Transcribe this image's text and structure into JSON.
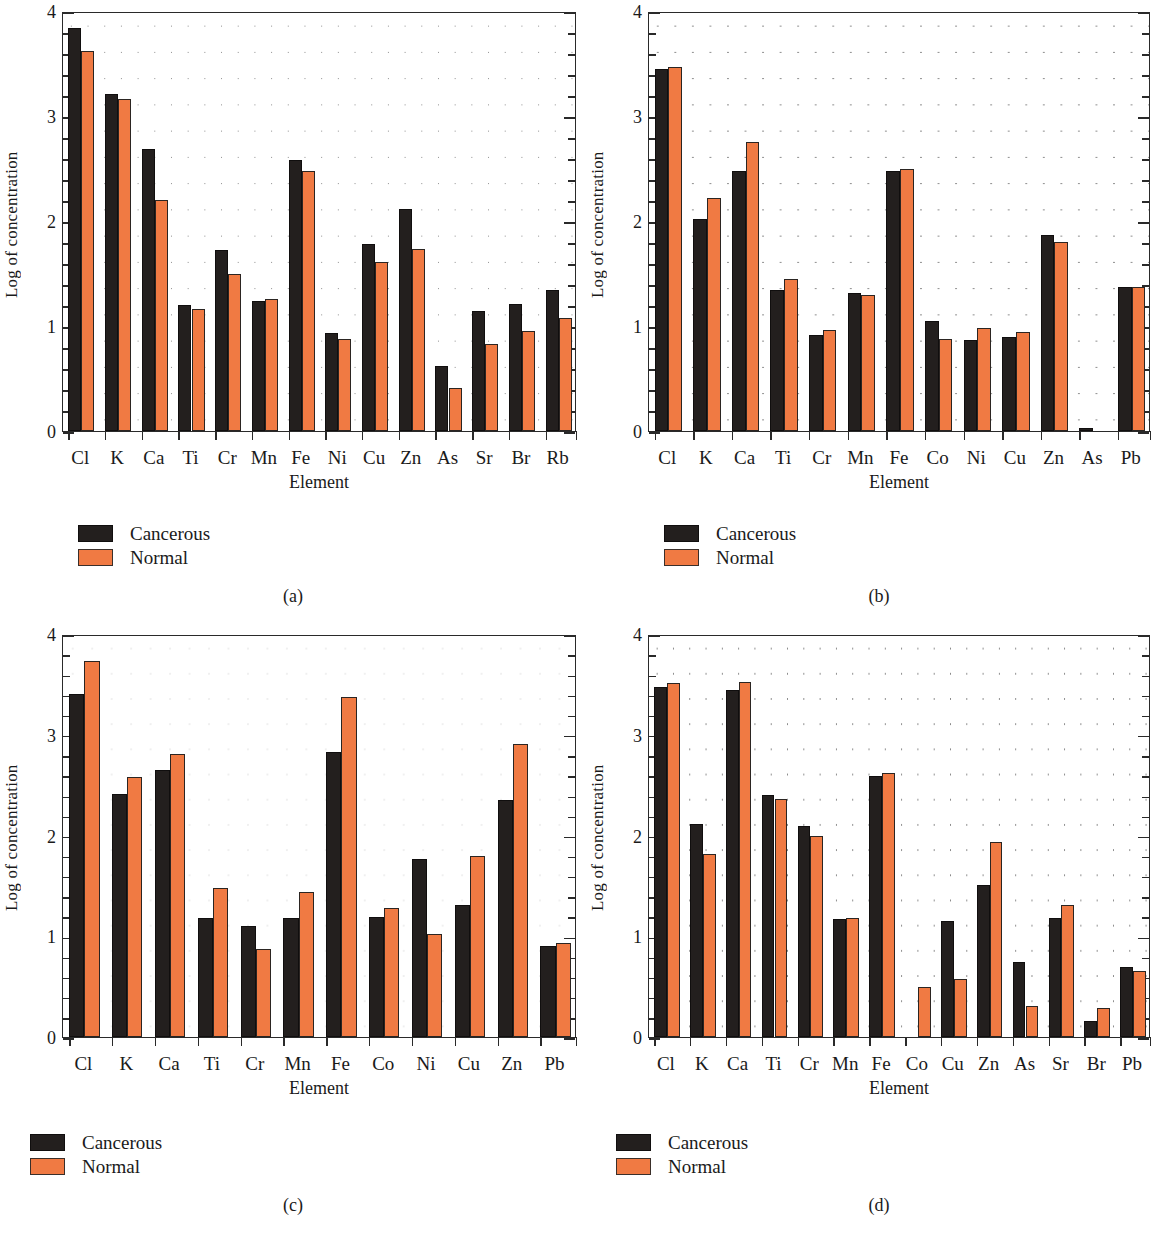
{
  "figure": {
    "axis": {
      "ylabel": "Log of concentration",
      "xlabel": "Element",
      "yticks": [
        "0",
        "1",
        "2",
        "3",
        "4"
      ],
      "ylim": [
        0,
        4
      ]
    },
    "legend": {
      "cancerous_label": "Cancerous",
      "normal_label": "Normal",
      "cancerous_color": "#231f1e",
      "normal_color": "#f07a43"
    },
    "captions": [
      "(a)",
      "(b)",
      "(c)",
      "(d)"
    ]
  },
  "chart_data": [
    {
      "type": "bar",
      "panel": "(a)",
      "title": "",
      "xlabel": "Element",
      "ylabel": "Log of concentration",
      "ylim": [
        0,
        4
      ],
      "grid": "dotted",
      "legend_position": "below-left",
      "categories": [
        "Cl",
        "K",
        "Ca",
        "Ti",
        "Cr",
        "Mn",
        "Fe",
        "Ni",
        "Cu",
        "Zn",
        "As",
        "Sr",
        "Br",
        "Rb"
      ],
      "series": [
        {
          "name": "Cancerous",
          "color": "#231f1e",
          "values": [
            3.84,
            3.21,
            2.69,
            1.2,
            1.72,
            1.24,
            2.58,
            0.93,
            1.78,
            2.11,
            0.62,
            1.14,
            1.21,
            1.34
          ]
        },
        {
          "name": "Normal",
          "color": "#f07a43",
          "values": [
            3.62,
            3.16,
            2.2,
            1.16,
            1.5,
            1.26,
            2.48,
            0.88,
            1.61,
            1.73,
            0.41,
            0.83,
            0.95,
            1.08
          ]
        }
      ]
    },
    {
      "type": "bar",
      "panel": "(b)",
      "title": "",
      "xlabel": "Element",
      "ylabel": "Log of concentration",
      "ylim": [
        0,
        4
      ],
      "grid": "dotted",
      "legend_position": "below-left",
      "categories": [
        "Cl",
        "K",
        "Ca",
        "Ti",
        "Cr",
        "Mn",
        "Fe",
        "Co",
        "Ni",
        "Cu",
        "Zn",
        "As",
        "Pb"
      ],
      "series": [
        {
          "name": "Cancerous",
          "color": "#231f1e",
          "values": [
            3.45,
            2.02,
            2.48,
            1.34,
            0.91,
            1.31,
            2.48,
            1.05,
            0.87,
            0.9,
            1.87,
            0.03,
            1.37
          ]
        },
        {
          "name": "Normal",
          "color": "#f07a43",
          "values": [
            3.47,
            2.22,
            2.75,
            1.45,
            0.96,
            1.3,
            2.5,
            0.88,
            0.98,
            0.94,
            1.8,
            0.0,
            1.37
          ]
        }
      ]
    },
    {
      "type": "bar",
      "panel": "(c)",
      "title": "",
      "xlabel": "Element",
      "ylabel": "Log of concentration",
      "ylim": [
        0,
        4
      ],
      "grid": "dotted",
      "legend_position": "below-left",
      "categories": [
        "Cl",
        "K",
        "Ca",
        "Ti",
        "Cr",
        "Mn",
        "Fe",
        "Co",
        "Ni",
        "Cu",
        "Zn",
        "Pb"
      ],
      "series": [
        {
          "name": "Cancerous",
          "color": "#231f1e",
          "values": [
            3.4,
            2.41,
            2.65,
            1.18,
            1.1,
            1.18,
            2.83,
            1.19,
            1.77,
            1.31,
            2.35,
            0.9
          ]
        },
        {
          "name": "Normal",
          "color": "#f07a43",
          "values": [
            3.73,
            2.58,
            2.81,
            1.48,
            0.87,
            1.44,
            3.37,
            1.28,
            1.02,
            1.8,
            2.91,
            0.93
          ]
        }
      ]
    },
    {
      "type": "bar",
      "panel": "(d)",
      "title": "",
      "xlabel": "Element",
      "ylabel": "Log of concentration",
      "ylim": [
        0,
        4
      ],
      "grid": "dotted",
      "legend_position": "below-left",
      "categories": [
        "Cl",
        "K",
        "Ca",
        "Ti",
        "Cr",
        "Mn",
        "Fe",
        "Co",
        "Cu",
        "Zn",
        "As",
        "Sr",
        "Br",
        "Pb"
      ],
      "series": [
        {
          "name": "Cancerous",
          "color": "#231f1e",
          "values": [
            3.47,
            2.11,
            3.44,
            2.4,
            2.09,
            1.17,
            2.59,
            0.0,
            1.15,
            1.51,
            0.74,
            1.18,
            0.16,
            0.69
          ]
        },
        {
          "name": "Normal",
          "color": "#f07a43",
          "values": [
            3.51,
            1.82,
            3.52,
            2.36,
            2.0,
            1.18,
            2.62,
            0.5,
            0.58,
            1.94,
            0.31,
            1.31,
            0.29,
            0.66
          ]
        }
      ]
    }
  ]
}
